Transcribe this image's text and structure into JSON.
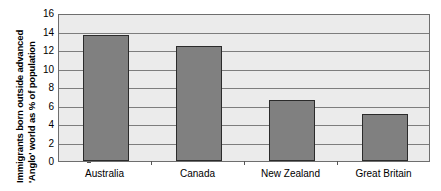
{
  "chart_data": {
    "type": "bar",
    "title": "",
    "subtitle": "",
    "xlabel": "",
    "ylabel": "Immigrants born outside advanced 'Anglo' world as % of population",
    "ylabel_lines": [
      "Immigrants born outside advanced",
      "'Anglo' world as % of population"
    ],
    "categories": [
      "Australia",
      "Canada",
      "New Zealand",
      "Great Britain"
    ],
    "values": [
      13.6,
      12.4,
      6.6,
      5.1
    ],
    "series": [
      {
        "name": "Immigrants born outside advanced 'Anglo' world as % of population",
        "values": [
          13.6,
          12.4,
          6.6,
          5.1
        ]
      }
    ],
    "ylim": [
      0,
      16
    ],
    "ytick_step": 2,
    "ytick_labels": [
      "0",
      "2",
      "4",
      "6",
      "8",
      "10",
      "12",
      "14",
      "16"
    ],
    "ytick_values": [
      0,
      2,
      4,
      6,
      8,
      10,
      12,
      14,
      16
    ],
    "grid": true,
    "grid_axis": "y",
    "legend": false,
    "legend_position": "none"
  },
  "style": {
    "bar_fill": "#808080",
    "bar_border": "#2b2b2b",
    "plot_background": "#ebebeb",
    "gridline_color": "#7d7d7d",
    "axis_color": "#6e6e6e",
    "text_color": "#000000",
    "page_background": "#ffffff"
  }
}
